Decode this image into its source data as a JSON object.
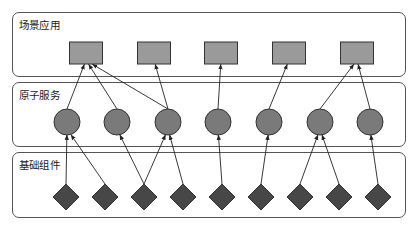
{
  "layers": [
    {
      "id": "scene-apps",
      "label": "场景应用",
      "x": 12,
      "y": 12,
      "w": 394,
      "h": 65
    },
    {
      "id": "atomic-services",
      "label": "原子服务",
      "x": 12,
      "y": 82,
      "w": 394,
      "h": 65
    },
    {
      "id": "base-components",
      "label": "基础组件",
      "x": 12,
      "y": 152,
      "w": 394,
      "h": 66
    }
  ],
  "colors": {
    "rect_fill": "#9a9a9a",
    "circle_fill": "#7a7a7a",
    "diamond_fill": "#474747",
    "stroke": "#333333",
    "arrow": "#222222"
  },
  "nodes": {
    "rects": [
      {
        "id": "r1",
        "cx": 86,
        "cy": 53,
        "w": 33,
        "h": 22
      },
      {
        "id": "r2",
        "cx": 154,
        "cy": 53,
        "w": 33,
        "h": 22
      },
      {
        "id": "r3",
        "cx": 221,
        "cy": 53,
        "w": 33,
        "h": 22
      },
      {
        "id": "r4",
        "cx": 289,
        "cy": 53,
        "w": 33,
        "h": 22
      },
      {
        "id": "r5",
        "cx": 357,
        "cy": 53,
        "w": 33,
        "h": 22
      }
    ],
    "circles": [
      {
        "id": "c1",
        "cx": 67,
        "cy": 122,
        "r": 13
      },
      {
        "id": "c2",
        "cx": 117,
        "cy": 122,
        "r": 13
      },
      {
        "id": "c3",
        "cx": 168,
        "cy": 122,
        "r": 13
      },
      {
        "id": "c4",
        "cx": 218,
        "cy": 122,
        "r": 13
      },
      {
        "id": "c5",
        "cx": 269,
        "cy": 122,
        "r": 13
      },
      {
        "id": "c6",
        "cx": 320,
        "cy": 122,
        "r": 13
      },
      {
        "id": "c7",
        "cx": 370,
        "cy": 122,
        "r": 13
      }
    ],
    "diamonds": [
      {
        "id": "d1",
        "cx": 66,
        "cy": 197,
        "s": 13
      },
      {
        "id": "d2",
        "cx": 105,
        "cy": 197,
        "s": 13
      },
      {
        "id": "d3",
        "cx": 144,
        "cy": 197,
        "s": 13
      },
      {
        "id": "d4",
        "cx": 183,
        "cy": 197,
        "s": 13
      },
      {
        "id": "d5",
        "cx": 222,
        "cy": 197,
        "s": 13
      },
      {
        "id": "d6",
        "cx": 261,
        "cy": 197,
        "s": 13
      },
      {
        "id": "d7",
        "cx": 300,
        "cy": 197,
        "s": 13
      },
      {
        "id": "d8",
        "cx": 339,
        "cy": 197,
        "s": 13
      },
      {
        "id": "d9",
        "cx": 378,
        "cy": 197,
        "s": 13
      }
    ]
  },
  "edges": [
    {
      "from": "c1",
      "to": "r1"
    },
    {
      "from": "c2",
      "to": "r1"
    },
    {
      "from": "c3",
      "to": "r1"
    },
    {
      "from": "c3",
      "to": "r2"
    },
    {
      "from": "c4",
      "to": "r3"
    },
    {
      "from": "c5",
      "to": "r4"
    },
    {
      "from": "c6",
      "to": "r5"
    },
    {
      "from": "c7",
      "to": "r5"
    },
    {
      "from": "d1",
      "to": "c1"
    },
    {
      "from": "d2",
      "to": "c1"
    },
    {
      "from": "d3",
      "to": "c2"
    },
    {
      "from": "d3",
      "to": "c3"
    },
    {
      "from": "d4",
      "to": "c3"
    },
    {
      "from": "d5",
      "to": "c4"
    },
    {
      "from": "d6",
      "to": "c5"
    },
    {
      "from": "d7",
      "to": "c6"
    },
    {
      "from": "d8",
      "to": "c6"
    },
    {
      "from": "d9",
      "to": "c7"
    }
  ]
}
